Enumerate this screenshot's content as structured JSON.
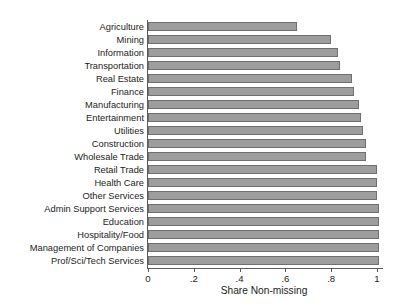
{
  "chart_data": {
    "type": "bar",
    "orientation": "horizontal",
    "title": "",
    "subtitle": "",
    "xlabel": "Share Non-missing",
    "ylabel": "",
    "xlim": [
      0,
      1.05
    ],
    "xticks": [
      0,
      0.2,
      0.4,
      0.6,
      0.8,
      1
    ],
    "xticklabels": [
      "0",
      ".2",
      ".4",
      ".6",
      ".8",
      "1"
    ],
    "grid": false,
    "legend": null,
    "bar_color": "#9d9d9d",
    "bar_edge_color": "#6f6f6f",
    "axis_color": "#5a5a5a",
    "background": "#ffffff",
    "categories": [
      "Agriculture",
      "Mining",
      "Information",
      "Transportation",
      "Real Estate",
      "Finance",
      "Manufacturing",
      "Entertainment",
      "Utilities",
      "Construction",
      "Wholesale Trade",
      "Retail Trade",
      "Health Care",
      "Other Services",
      "Admin Support Services",
      "Education",
      "Hospitality/Food",
      "Management of Companies",
      "Prof/Sci/Tech Services"
    ],
    "values": [
      0.65,
      0.8,
      0.83,
      0.84,
      0.89,
      0.9,
      0.92,
      0.93,
      0.94,
      0.95,
      0.95,
      1.0,
      1.0,
      1.0,
      1.01,
      1.01,
      1.01,
      1.01,
      1.01
    ]
  }
}
